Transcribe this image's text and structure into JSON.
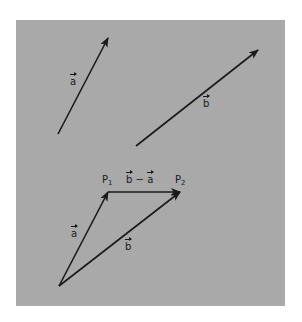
{
  "figure": {
    "background_color": "#a9a9a9",
    "line_color": "#1a1a1a",
    "top_vectors": {
      "a": {
        "symbol": "a",
        "from": [
          58,
          134
        ],
        "to": [
          108,
          38
        ]
      },
      "b": {
        "symbol": "b",
        "from": [
          136,
          146
        ],
        "to": [
          258,
          50
        ]
      }
    },
    "triangle": {
      "origin": [
        59,
        286
      ],
      "P1": {
        "name": "P",
        "sub": "1",
        "pos": [
          108,
          192
        ]
      },
      "P2": {
        "name": "P",
        "sub": "2",
        "pos": [
          180,
          192
        ]
      },
      "vector_a": {
        "symbol": "a"
      },
      "vector_b": {
        "symbol": "b"
      },
      "difference": {
        "left": "b",
        "op": "−",
        "right": "a"
      }
    }
  }
}
